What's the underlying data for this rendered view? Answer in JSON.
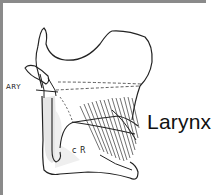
{
  "figure": {
    "title": "Larynx",
    "annotations": [
      {
        "id": "ary",
        "text": "ARY"
      },
      {
        "id": "cr",
        "text": "c R"
      }
    ],
    "colors": {
      "frame": "#8a8a8a",
      "ink": "#222222",
      "shade": "#e6e6e6",
      "background": "#ffffff"
    }
  }
}
